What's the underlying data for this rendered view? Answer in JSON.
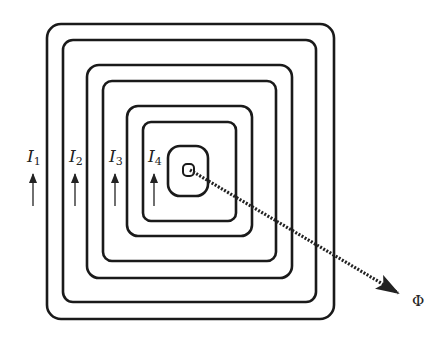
{
  "diagram": {
    "loops": [
      {
        "x": 47,
        "y": 24,
        "w": 287,
        "h": 295,
        "r": 14
      },
      {
        "x": 63,
        "y": 40,
        "w": 253,
        "h": 262,
        "r": 10
      },
      {
        "x": 87,
        "y": 65,
        "w": 205,
        "h": 213,
        "r": 12
      },
      {
        "x": 103,
        "y": 81,
        "w": 173,
        "h": 180,
        "r": 9
      },
      {
        "x": 127,
        "y": 106,
        "w": 125,
        "h": 130,
        "r": 11
      },
      {
        "x": 143,
        "y": 122,
        "w": 93,
        "h": 99,
        "r": 8
      },
      {
        "x": 168,
        "y": 146,
        "w": 40,
        "h": 50,
        "r": 12
      },
      {
        "x": 183,
        "y": 164,
        "w": 11,
        "h": 12,
        "r": 4
      }
    ],
    "currents": [
      {
        "label": "I",
        "sub": "1",
        "x": 27,
        "y": 162,
        "ax": 33
      },
      {
        "label": "I",
        "sub": "2",
        "x": 69,
        "y": 162,
        "ax": 75
      },
      {
        "label": "I",
        "sub": "3",
        "x": 109,
        "y": 162,
        "ax": 115
      },
      {
        "label": "I",
        "sub": "4",
        "x": 148,
        "y": 162,
        "ax": 154
      }
    ],
    "flux": {
      "label": "Φ",
      "x1": 190,
      "y1": 170,
      "x2": 398,
      "y2": 293,
      "lx": 412,
      "ly": 306
    }
  }
}
